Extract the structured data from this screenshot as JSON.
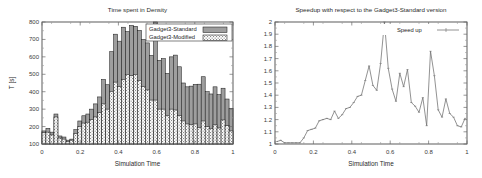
{
  "figure": {
    "panels": [
      "left",
      "right"
    ]
  },
  "chart_data": [
    {
      "id": "time-spent-in-density",
      "type": "bar",
      "title": "Time spent in Density",
      "xlabel": "Simulation Time",
      "ylabel": "T [s]",
      "xlim": [
        0,
        1
      ],
      "ylim": [
        100,
        800
      ],
      "xticks": [
        0,
        0.2,
        0.4,
        0.6,
        0.8,
        1
      ],
      "xticklabels": [
        "0",
        "0.2",
        "0.4",
        "0.6",
        "0.8",
        "1"
      ],
      "yticks": [
        100,
        200,
        300,
        400,
        500,
        600,
        700,
        800
      ],
      "yticklabels": [
        "100",
        "200",
        "300",
        "400",
        "500",
        "600",
        "700",
        "800"
      ],
      "grid": false,
      "legend_position": "top-right",
      "legend": [
        "Gadget3-Standard",
        "Gadget3-Modified"
      ],
      "bar_width": 0.0208,
      "x": [
        0.01,
        0.031,
        0.052,
        0.073,
        0.094,
        0.115,
        0.136,
        0.156,
        0.177,
        0.198,
        0.219,
        0.24,
        0.26,
        0.281,
        0.302,
        0.323,
        0.344,
        0.365,
        0.385,
        0.406,
        0.427,
        0.448,
        0.469,
        0.49,
        0.51,
        0.531,
        0.552,
        0.573,
        0.594,
        0.615,
        0.635,
        0.656,
        0.677,
        0.698,
        0.719,
        0.74,
        0.76,
        0.781,
        0.802,
        0.823,
        0.844,
        0.865,
        0.885,
        0.906,
        0.927,
        0.948,
        0.969,
        0.99
      ],
      "series": [
        {
          "name": "Gadget3-Standard",
          "values": [
            175,
            190,
            168,
            272,
            146,
            140,
            122,
            128,
            182,
            232,
            262,
            272,
            300,
            330,
            370,
            470,
            440,
            630,
            730,
            690,
            770,
            745,
            780,
            775,
            752,
            700,
            680,
            608,
            800,
            580,
            590,
            505,
            600,
            610,
            543,
            450,
            428,
            432,
            442,
            443,
            486,
            400,
            387,
            428,
            383,
            420,
            358,
            305
          ]
        },
        {
          "name": "Gadget3-Modified",
          "values": [
            165,
            168,
            152,
            255,
            134,
            128,
            115,
            122,
            160,
            200,
            220,
            225,
            240,
            255,
            280,
            330,
            300,
            402,
            455,
            430,
            470,
            500,
            492,
            500,
            465,
            430,
            410,
            352,
            352,
            300,
            300,
            262,
            300,
            295,
            263,
            232,
            215,
            212,
            215,
            195,
            232,
            200,
            190,
            210,
            192,
            238,
            205,
            175
          ]
        }
      ]
    },
    {
      "id": "speedup-vs-standard",
      "type": "line",
      "title": "Speedup with respect to the Gadget3-Standard version",
      "xlabel": "Simulation Time",
      "ylabel": "",
      "xlim": [
        0,
        1
      ],
      "ylim": [
        1,
        2
      ],
      "xticks": [
        0,
        0.2,
        0.4,
        0.6,
        0.8,
        1
      ],
      "xticklabels": [
        "0",
        "0.2",
        "0.4",
        "0.6",
        "0.8",
        "1"
      ],
      "yticks": [
        1,
        1.1,
        1.2,
        1.3,
        1.4,
        1.5,
        1.6,
        1.7,
        1.8,
        1.9,
        2
      ],
      "yticklabels": [
        "1",
        "1.1",
        "1.2",
        "1.3",
        "1.4",
        "1.5",
        "1.6",
        "1.7",
        "1.8",
        "1.9",
        "2"
      ],
      "grid": false,
      "legend_position": "top-right",
      "legend": [
        "Speed up"
      ],
      "series": [
        {
          "name": "Speed up",
          "x": [
            0.01,
            0.03,
            0.05,
            0.07,
            0.09,
            0.11,
            0.13,
            0.15,
            0.17,
            0.19,
            0.21,
            0.23,
            0.25,
            0.27,
            0.29,
            0.31,
            0.33,
            0.35,
            0.37,
            0.39,
            0.41,
            0.43,
            0.45,
            0.47,
            0.49,
            0.51,
            0.53,
            0.55,
            0.57,
            0.59,
            0.61,
            0.63,
            0.65,
            0.67,
            0.69,
            0.71,
            0.73,
            0.75,
            0.77,
            0.79,
            0.81,
            0.83,
            0.85,
            0.87,
            0.89,
            0.91,
            0.93,
            0.95,
            0.97,
            0.99
          ],
          "values": [
            1.02,
            1.03,
            1.01,
            1.01,
            1.01,
            1.01,
            1.01,
            1.05,
            1.11,
            1.12,
            1.13,
            1.19,
            1.2,
            1.21,
            1.2,
            1.27,
            1.21,
            1.24,
            1.29,
            1.3,
            1.34,
            1.39,
            1.4,
            1.52,
            1.64,
            1.48,
            1.44,
            1.66,
            2.0,
            1.62,
            1.45,
            1.35,
            1.58,
            1.47,
            1.61,
            1.34,
            1.31,
            1.26,
            1.38,
            1.15,
            1.76,
            1.56,
            1.28,
            1.22,
            1.37,
            1.25,
            1.22,
            1.15,
            1.14,
            1.21
          ]
        }
      ]
    }
  ]
}
